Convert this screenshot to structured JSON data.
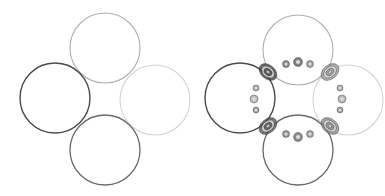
{
  "figure": {
    "width": 385,
    "height": 196,
    "background": "#ffffff",
    "panels": [
      {
        "name": "left-panel-rings",
        "circles": [
          {
            "id": "top",
            "cx": 105,
            "cy": 48,
            "r": 35,
            "stroke": "#b0b0b0",
            "width": 1.1
          },
          {
            "id": "left",
            "cx": 55,
            "cy": 98,
            "r": 35,
            "stroke": "#4a4a4a",
            "width": 1.4
          },
          {
            "id": "right",
            "cx": 155,
            "cy": 100,
            "r": 35,
            "stroke": "#d4d4d4",
            "width": 1.1
          },
          {
            "id": "bottom",
            "cx": 105,
            "cy": 150,
            "r": 35,
            "stroke": "#6a6a6a",
            "width": 1.3
          }
        ]
      },
      {
        "name": "right-panel-rings-with-density",
        "circles": [
          {
            "id": "top",
            "cx": 298,
            "cy": 50,
            "r": 35,
            "stroke": "#b0b0b0",
            "width": 1.1
          },
          {
            "id": "left",
            "cx": 240,
            "cy": 98,
            "r": 35,
            "stroke": "#4a4a4a",
            "width": 1.4
          },
          {
            "id": "right",
            "cx": 348,
            "cy": 100,
            "r": 35,
            "stroke": "#d4d4d4",
            "width": 1.1
          },
          {
            "id": "bottom",
            "cx": 298,
            "cy": 150,
            "r": 35,
            "stroke": "#6a6a6a",
            "width": 1.3
          }
        ],
        "density_lobes": [
          {
            "cx": 268,
            "cy": 72,
            "rx": 10,
            "ry": 7,
            "rot": 40,
            "fill": "#3a3a3a"
          },
          {
            "cx": 330,
            "cy": 72,
            "rx": 10,
            "ry": 7,
            "rot": -40,
            "fill": "#9a9a9a"
          },
          {
            "cx": 268,
            "cy": 126,
            "rx": 10,
            "ry": 7,
            "rot": -40,
            "fill": "#4a4a4a"
          },
          {
            "cx": 330,
            "cy": 126,
            "rx": 10,
            "ry": 7,
            "rot": 40,
            "fill": "#8a8a8a"
          }
        ],
        "small_beads": [
          {
            "cx": 286,
            "cy": 64,
            "r": 3.5,
            "fill": "#5a5a5a"
          },
          {
            "cx": 298,
            "cy": 62,
            "r": 4.5,
            "fill": "#4a4a4a"
          },
          {
            "cx": 310,
            "cy": 64,
            "r": 3.5,
            "fill": "#7a7a7a"
          },
          {
            "cx": 286,
            "cy": 134,
            "r": 3.5,
            "fill": "#6a6a6a"
          },
          {
            "cx": 298,
            "cy": 137,
            "r": 4.5,
            "fill": "#5a5a5a"
          },
          {
            "cx": 310,
            "cy": 134,
            "r": 3.5,
            "fill": "#7a7a7a"
          },
          {
            "cx": 256,
            "cy": 88,
            "r": 3,
            "fill": "#8a8a8a"
          },
          {
            "cx": 254,
            "cy": 99,
            "r": 4,
            "fill": "#a0a0a0"
          },
          {
            "cx": 256,
            "cy": 110,
            "r": 3,
            "fill": "#7a7a7a"
          },
          {
            "cx": 340,
            "cy": 88,
            "r": 3,
            "fill": "#8a8a8a"
          },
          {
            "cx": 342,
            "cy": 99,
            "r": 4,
            "fill": "#9a9a9a"
          },
          {
            "cx": 340,
            "cy": 110,
            "r": 3,
            "fill": "#7a7a7a"
          }
        ]
      }
    ]
  }
}
